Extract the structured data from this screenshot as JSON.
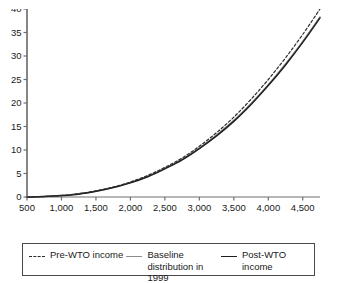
{
  "figure": {
    "title_partial": "",
    "background": "#ffffff"
  },
  "axis": {
    "x_title": "Annual per capita income (yuan)",
    "y_title": "",
    "x_ticks": [
      "500",
      "1,000",
      "1,500",
      "2,000",
      "2,500",
      "3,000",
      "3,500",
      "4,000",
      "4,500"
    ],
    "y_ticks": [
      "0",
      "5",
      "10",
      "15",
      "20",
      "25",
      "30",
      "35",
      "40"
    ]
  },
  "legend": {
    "items": [
      {
        "label": "Pre-WTO income",
        "style": "dashed",
        "color": "#2b2b2b",
        "icon": "dashed-line-icon"
      },
      {
        "label": "Baseline distribution in 1999",
        "style": "solid",
        "color": "#8c8c8c",
        "icon": "solid-line-icon"
      },
      {
        "label": "Post-WTO income",
        "style": "solid",
        "color": "#1f1f1f",
        "icon": "solid-line-icon"
      }
    ]
  },
  "chart_data": {
    "type": "line",
    "title": "",
    "xlabel": "Annual per capita income (yuan)",
    "ylabel": "",
    "xlim": [
      500,
      4750
    ],
    "ylim": [
      0,
      40
    ],
    "grid": false,
    "legend_position": "bottom",
    "x": [
      500,
      750,
      1000,
      1250,
      1500,
      1750,
      2000,
      2250,
      2500,
      2750,
      3000,
      3250,
      3500,
      3750,
      4000,
      4250,
      4500,
      4750
    ],
    "series": [
      {
        "name": "Pre-WTO income",
        "style": "dashed",
        "color": "#2b2b2b",
        "values": [
          0.0,
          0.1,
          0.3,
          0.7,
          1.3,
          2.1,
          3.2,
          4.6,
          6.3,
          8.3,
          10.8,
          13.7,
          17.0,
          20.8,
          25.0,
          29.6,
          34.6,
          40.0
        ]
      },
      {
        "name": "Baseline distribution in 1999",
        "style": "solid",
        "color": "#8c8c8c",
        "values": [
          0.0,
          0.1,
          0.3,
          0.7,
          1.2,
          2.0,
          3.1,
          4.4,
          6.1,
          8.0,
          10.4,
          13.2,
          16.3,
          19.9,
          23.9,
          28.3,
          33.1,
          38.3
        ]
      },
      {
        "name": "Post-WTO income",
        "style": "solid",
        "color": "#1f1f1f",
        "values": [
          0.0,
          0.1,
          0.3,
          0.6,
          1.2,
          2.0,
          3.0,
          4.3,
          6.0,
          7.9,
          10.3,
          13.0,
          16.1,
          19.7,
          23.7,
          28.1,
          32.9,
          38.1
        ]
      }
    ]
  }
}
